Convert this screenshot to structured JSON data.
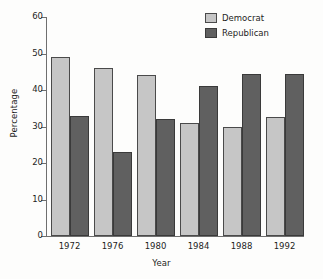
{
  "chart_data": {
    "type": "bar",
    "title": "",
    "xlabel": "Year",
    "ylabel": "Percentage",
    "categories": [
      "1972",
      "1976",
      "1980",
      "1984",
      "1988",
      "1992"
    ],
    "series": [
      {
        "name": "Democrat",
        "color": "#c6c6c6",
        "values": [
          49,
          46,
          44,
          31,
          30,
          32.5
        ]
      },
      {
        "name": "Republican",
        "color": "#606060",
        "values": [
          33,
          23,
          32,
          41,
          44.5,
          44.5
        ]
      }
    ],
    "ylim": [
      0,
      60
    ],
    "yticks": [
      "0",
      "10",
      "20",
      "30",
      "40",
      "50",
      "60"
    ],
    "ytick_values": [
      0,
      10,
      20,
      30,
      40,
      50,
      60
    ],
    "grid": false,
    "legend_position": "top-right",
    "legend_entries": [
      "Democrat",
      "Republican"
    ]
  }
}
